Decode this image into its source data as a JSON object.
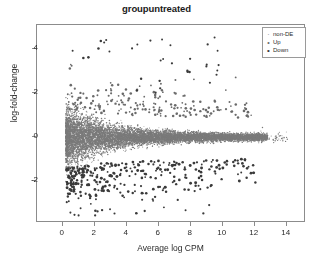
{
  "chart_data": {
    "type": "scatter",
    "title": "groupuntreated",
    "xlabel": "Average log CPM",
    "ylabel": "log-fold-change",
    "xlim": [
      -1.6,
      15.2
    ],
    "ylim": [
      -3.9,
      5.1
    ],
    "xticks": [
      "0",
      "2",
      "4",
      "6",
      "8",
      "10",
      "12",
      "14"
    ],
    "xtick_values": [
      0,
      2,
      4,
      6,
      8,
      10,
      12,
      14
    ],
    "yticks": [
      "4",
      "2",
      "0",
      "-2"
    ],
    "ytick_values": [
      4,
      2,
      0,
      -2
    ],
    "grid": false,
    "legend_position": "top-right",
    "series": [
      {
        "name": "non-DE",
        "color": "#7a7a7a",
        "marker": "dot",
        "point_size": 1.0,
        "count": 9000,
        "description": "dense horizontal band centred on log-fold-change 0, widest at low CPM and tapering toward high CPM"
      },
      {
        "name": "Up",
        "color": "#6a6a6a",
        "marker": "dot",
        "point_size": 1.6,
        "count": 190,
        "description": "points above the band with positive log-fold-change"
      },
      {
        "name": "Down",
        "color": "#3a3a3a",
        "marker": "dot",
        "point_size": 2.0,
        "count": 300,
        "description": "darker larger points below the band with negative log-fold-change, plus sparse high outliers"
      }
    ]
  },
  "legend": {
    "entries": [
      {
        "label": "non-DE",
        "symbol": "·"
      },
      {
        "label": "Up",
        "symbol": "•"
      },
      {
        "label": "Down",
        "symbol": "•"
      }
    ]
  },
  "colors": {
    "frame": "#8c8c8c",
    "text": "#2b2b2b",
    "background": "#ffffff"
  }
}
